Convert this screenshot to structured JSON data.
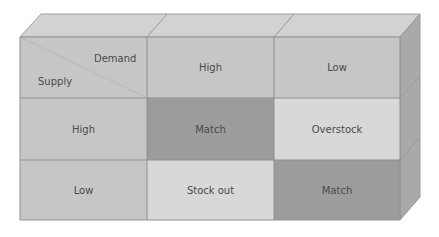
{
  "diagram": {
    "type": "3d-matrix",
    "axes": {
      "row_label": "Supply",
      "column_label": "Demand"
    },
    "columns": [
      "High",
      "Low"
    ],
    "rows": [
      {
        "label": "High",
        "cells": [
          "Match",
          "Overstock"
        ]
      },
      {
        "label": "Low",
        "cells": [
          "Stock out",
          "Match"
        ]
      }
    ],
    "colors": {
      "header": "#c4c4c4",
      "match": "#9c9c9c",
      "mismatch": "#d6d6d6",
      "top_face": "#d0d0d0",
      "side_face": "#a8a8a8",
      "grid_line": "#8e8e8e"
    }
  }
}
